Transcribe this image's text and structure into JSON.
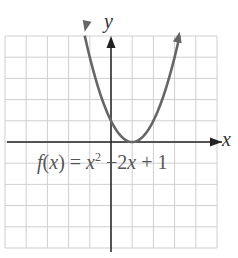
{
  "chart_data": {
    "type": "line",
    "title": "",
    "function_label": "f(x) = x^2 - 2x + 1",
    "xlabel": "x",
    "ylabel": "y",
    "xlim": [
      -5,
      5
    ],
    "ylim": [
      -5,
      5
    ],
    "grid": true,
    "grid_step": 1,
    "tick_labels": false,
    "series": [
      {
        "name": "f(x) = x^2 - 2x + 1",
        "x": [
          -1.24,
          -1,
          0,
          1,
          2,
          3,
          3.24
        ],
        "y": [
          5,
          4,
          1,
          0,
          1,
          4,
          5
        ],
        "arrows_at_ends": true
      }
    ],
    "vertex": [
      1,
      0
    ]
  },
  "labels": {
    "y_axis": "y",
    "x_axis": "x",
    "eq_f": "f",
    "eq_open": "(",
    "eq_x1": "x",
    "eq_close_eq": ") = ",
    "eq_x2": "x",
    "eq_sup": "2",
    "eq_mid": " −2",
    "eq_x3": "x",
    "eq_tail": " + 1"
  },
  "colors": {
    "grid": "#c8c8c8",
    "axis": "#222222",
    "curve": "#666666",
    "text": "#444444"
  }
}
